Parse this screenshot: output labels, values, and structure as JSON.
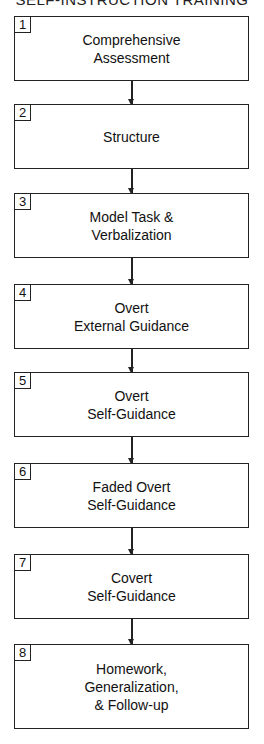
{
  "title": "SELF-INSTRUCTION TRAINING",
  "steps": [
    {
      "number": "1",
      "label": "Comprehensive\nAssessment"
    },
    {
      "number": "2",
      "label": "Structure"
    },
    {
      "number": "3",
      "label": "Model Task &\nVerbalization"
    },
    {
      "number": "4",
      "label": "Overt\nExternal Guidance"
    },
    {
      "number": "5",
      "label": "Overt\nSelf-Guidance"
    },
    {
      "number": "6",
      "label": "Faded Overt\nSelf-Guidance"
    },
    {
      "number": "7",
      "label": "Covert\nSelf-Guidance"
    },
    {
      "number": "8",
      "label": "Homework,\nGeneralization,\n& Follow-up"
    }
  ],
  "colors": {
    "line": "#222222",
    "background": "#ffffff"
  }
}
